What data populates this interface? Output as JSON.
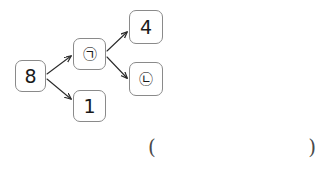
{
  "diagram": {
    "type": "branching-flow",
    "nodes": [
      {
        "id": "start",
        "label": "8",
        "kind": "number"
      },
      {
        "id": "mid_a",
        "label": "㉠",
        "kind": "circled-mark"
      },
      {
        "id": "one",
        "label": "1",
        "kind": "number"
      },
      {
        "id": "four",
        "label": "4",
        "kind": "number"
      },
      {
        "id": "mid_b",
        "label": "㉡",
        "kind": "circled-mark"
      }
    ],
    "edges": [
      {
        "from": "start",
        "to": "mid_a",
        "direction": "up-right"
      },
      {
        "from": "start",
        "to": "one",
        "direction": "down-right"
      },
      {
        "from": "mid_a",
        "to": "four",
        "direction": "up-right"
      },
      {
        "from": "mid_a",
        "to": "mid_b",
        "direction": "down-right"
      }
    ],
    "stroke_color": "#8a8a8a",
    "arrow_color": "#2b2b2b",
    "text_color": "#1a1a1a",
    "background": "#ffffff"
  },
  "answer": {
    "open_paren": "(",
    "close_paren": ")",
    "value": ""
  }
}
